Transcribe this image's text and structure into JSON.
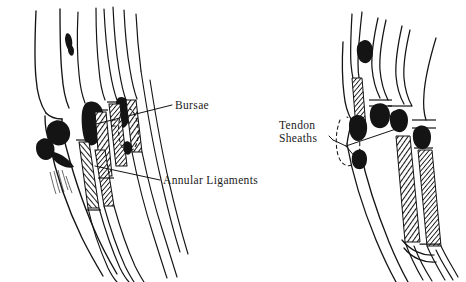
{
  "figure": {
    "background_color": "#ffffff",
    "ink_color": "#141414",
    "panels": [
      {
        "name": "left-limb-figure",
        "view": "lateral",
        "features": [
          "limb-outline",
          "tendon-strands",
          "bursae-ink-blobs",
          "annular-ligament-hatched-bands",
          "dashed-hidden-outline"
        ]
      },
      {
        "name": "right-limb-figure",
        "view": "dorsal",
        "features": [
          "limb-outline",
          "tendon-strands-fanned",
          "tendon-sheath-ink-blobs",
          "hatched-sheath-bands",
          "dashed-hidden-outline"
        ]
      }
    ]
  },
  "labels": {
    "bursae": "Bursae",
    "annular_ligaments": "Annular Ligaments",
    "tendon_sheaths_line1": "Tendon",
    "tendon_sheaths_line2": "Sheaths"
  }
}
